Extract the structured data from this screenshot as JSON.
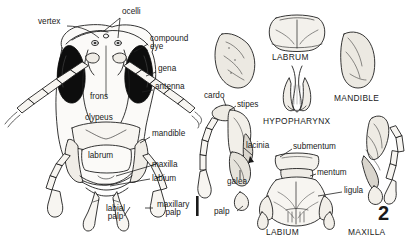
{
  "figure": {
    "number": "2",
    "type": "scientific-illustration",
    "scale_bar": {
      "present": true,
      "orientation": "vertical"
    }
  },
  "left_panel": {
    "name": "head-anterior-view",
    "labels": [
      {
        "id": "vertex",
        "text": "vertex",
        "x": 38,
        "y": 22,
        "leader": true
      },
      {
        "id": "ocelli",
        "text": "ocelli",
        "x": 122,
        "y": 13,
        "leader": true
      },
      {
        "id": "compound-eye",
        "text": "compound\neye",
        "line1": "compound",
        "line2": "eye",
        "x": 150,
        "y": 39,
        "leader": true
      },
      {
        "id": "gena",
        "text": "gena",
        "x": 158,
        "y": 69,
        "leader": true
      },
      {
        "id": "antenna",
        "text": "antenna",
        "x": 155,
        "y": 86,
        "leader": true
      },
      {
        "id": "frons",
        "text": "frons",
        "x": 72,
        "y": 97,
        "leader": false
      },
      {
        "id": "clypeus",
        "text": "clypeus",
        "x": 68,
        "y": 118,
        "leader": false
      },
      {
        "id": "mandible",
        "text": "mandible",
        "x": 152,
        "y": 134,
        "leader": true
      },
      {
        "id": "labrum",
        "text": "labrum",
        "x": 69,
        "y": 147,
        "leader": false
      },
      {
        "id": "maxilla",
        "text": "maxilla",
        "x": 152,
        "y": 163,
        "leader": true
      },
      {
        "id": "labium",
        "text": "labium",
        "x": 152,
        "y": 176,
        "leader": true
      },
      {
        "id": "labial-palp",
        "line1": "labial",
        "line2": "palp",
        "x": 115,
        "y": 210,
        "leader": true
      },
      {
        "id": "maxillary-palp",
        "line1": "maxillary",
        "line2": "palp",
        "x": 155,
        "y": 205,
        "leader": true
      }
    ]
  },
  "right_panel": {
    "name": "dissected-mouthparts",
    "parts": [
      {
        "id": "labrum-part",
        "title": "LABRUM",
        "x": 258,
        "y": 57
      },
      {
        "id": "mandible-part",
        "title": "MANDIBLE",
        "x": 332,
        "y": 98
      },
      {
        "id": "hypopharynx-part",
        "title": "HYPOPHARYNX",
        "x": 255,
        "y": 113
      },
      {
        "id": "labium-part",
        "title": "LABIUM",
        "x": 255,
        "y": 228
      },
      {
        "id": "maxilla-part",
        "title": "MAXILLA",
        "x": 352,
        "y": 228
      }
    ],
    "labels": [
      {
        "id": "cardo",
        "text": "cardo",
        "x": 206,
        "y": 96,
        "leader": true
      },
      {
        "id": "stipes",
        "text": "stipes",
        "x": 237,
        "y": 104,
        "leader": true
      },
      {
        "id": "lacinia",
        "text": "lacinia",
        "x": 245,
        "y": 146,
        "leader": true
      },
      {
        "id": "galea",
        "text": "galea",
        "x": 231,
        "y": 181,
        "leader": true
      },
      {
        "id": "palp",
        "text": "palp",
        "x": 238,
        "y": 213,
        "leader": true
      },
      {
        "id": "submentum",
        "text": "submentum",
        "x": 294,
        "y": 146,
        "leader": true
      },
      {
        "id": "mentum",
        "text": "mentum",
        "x": 318,
        "y": 172,
        "leader": true
      },
      {
        "id": "ligula",
        "text": "ligula",
        "x": 344,
        "y": 190,
        "leader": true
      }
    ]
  },
  "colors": {
    "ink": "#1a1a1a",
    "line": "#222222",
    "fill_light": "#f2f0ec",
    "fill_mid": "#d9d5cd",
    "eye_dark": "#0d0d0d",
    "background": "#ffffff"
  }
}
